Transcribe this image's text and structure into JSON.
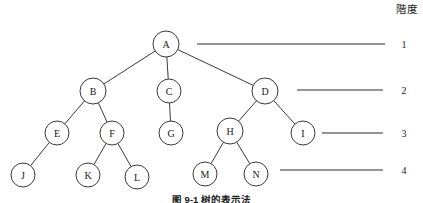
{
  "diagram": {
    "caption": "图 9-1  树的表示法",
    "level_column_header": "階度",
    "stroke_color": "#3a3a3a",
    "node_fill_color": "#ffffff",
    "text_color": "#1a1a1a"
  },
  "chart_data": {
    "type": "diagram",
    "title": "图 9-1  树的表示法",
    "nodes": [
      {
        "id": "A",
        "label": "A",
        "level": 1,
        "cx": 166,
        "cy": 44,
        "r": 13
      },
      {
        "id": "B",
        "label": "B",
        "level": 2,
        "cx": 93,
        "cy": 91,
        "r": 13
      },
      {
        "id": "C",
        "label": "C",
        "level": 2,
        "cx": 169,
        "cy": 91,
        "r": 12
      },
      {
        "id": "D",
        "label": "D",
        "level": 2,
        "cx": 265,
        "cy": 91,
        "r": 13
      },
      {
        "id": "E",
        "label": "E",
        "level": 3,
        "cx": 57,
        "cy": 133,
        "r": 12
      },
      {
        "id": "F",
        "label": "F",
        "level": 3,
        "cx": 112,
        "cy": 133,
        "r": 12
      },
      {
        "id": "G",
        "label": "G",
        "level": 3,
        "cx": 171,
        "cy": 133,
        "r": 12
      },
      {
        "id": "H",
        "label": "H",
        "level": 3,
        "cx": 230,
        "cy": 131,
        "r": 13
      },
      {
        "id": "I",
        "label": "I",
        "level": 3,
        "cx": 303,
        "cy": 133,
        "r": 12
      },
      {
        "id": "J",
        "label": "J",
        "level": 4,
        "cx": 23,
        "cy": 175,
        "r": 12
      },
      {
        "id": "K",
        "label": "K",
        "level": 4,
        "cx": 88,
        "cy": 175,
        "r": 12
      },
      {
        "id": "L",
        "label": "L",
        "level": 4,
        "cx": 137,
        "cy": 177,
        "r": 12
      },
      {
        "id": "M",
        "label": "M",
        "level": 4,
        "cx": 205,
        "cy": 174,
        "r": 12
      },
      {
        "id": "N",
        "label": "N",
        "level": 4,
        "cx": 256,
        "cy": 174,
        "r": 12
      }
    ],
    "edges": [
      {
        "from": "A",
        "to": "B"
      },
      {
        "from": "A",
        "to": "C"
      },
      {
        "from": "A",
        "to": "D"
      },
      {
        "from": "B",
        "to": "E"
      },
      {
        "from": "B",
        "to": "F"
      },
      {
        "from": "C",
        "to": "G"
      },
      {
        "from": "D",
        "to": "H"
      },
      {
        "from": "D",
        "to": "I"
      },
      {
        "from": "E",
        "to": "J"
      },
      {
        "from": "F",
        "to": "K"
      },
      {
        "from": "F",
        "to": "L"
      },
      {
        "from": "H",
        "to": "M"
      },
      {
        "from": "H",
        "to": "N"
      }
    ],
    "levels": [
      {
        "number": "1",
        "y": 44,
        "line_x1": 197,
        "line_x2": 385,
        "label_x": 404
      },
      {
        "number": "2",
        "y": 90,
        "line_x1": 297,
        "line_x2": 383,
        "label_x": 404
      },
      {
        "number": "3",
        "y": 133,
        "line_x1": 322,
        "line_x2": 383,
        "label_x": 404
      },
      {
        "number": "4",
        "y": 170,
        "line_x1": 280,
        "line_x2": 383,
        "label_x": 404
      }
    ]
  }
}
